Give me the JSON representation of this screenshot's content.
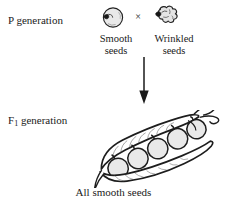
{
  "figure": {
    "type": "genetics-cross-diagram",
    "organism": "pea plant",
    "trait": "seed shape",
    "background_color": "#ffffff",
    "ink_color": "#1a1a1a",
    "seed_fill_color": "#e6e6e6"
  },
  "rows": {
    "parental": {
      "label": "P generation",
      "cross_symbol": "×",
      "parents": [
        {
          "icon": "smooth-pea-seed-icon",
          "label_line1": "Smooth",
          "label_line2": "seeds",
          "phenotype": "smooth",
          "shape": "round"
        },
        {
          "icon": "wrinkled-pea-seed-icon",
          "label_line1": "Wrinkled",
          "label_line2": "seeds",
          "phenotype": "wrinkled",
          "shape": "irregular"
        }
      ]
    },
    "arrow": {
      "icon": "down-arrow-icon",
      "direction": "down"
    },
    "filial": {
      "label_text": "F",
      "label_subscript": "1",
      "label_suffix": " generation",
      "icon": "open-pea-pod-icon",
      "pea_count": 5,
      "caption": "All smooth seeds"
    }
  }
}
